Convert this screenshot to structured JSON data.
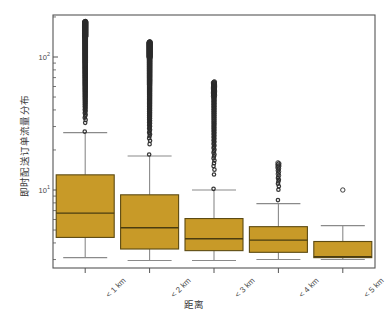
{
  "figure": {
    "y_axis_title": "即时配送订单流量分布",
    "x_axis_title": "距离",
    "y_tick_labels": [
      "10",
      "10"
    ],
    "y_tick_exponents": [
      "2",
      "1"
    ]
  },
  "chart_data": {
    "type": "box",
    "title": "",
    "xlabel": "距离",
    "ylabel": "即时配送订单流量分布",
    "yscale": "log",
    "ylim": [
      2.6,
      260
    ],
    "grid": false,
    "legend": null,
    "y_ticks_major": [
      10,
      100
    ],
    "y_ticks_major_text": [
      "10^1",
      "10^2"
    ],
    "categories": [
      "< 1 km",
      "< 2 km",
      "< 3 km",
      "< 4 km",
      "< 5 km"
    ],
    "boxes": [
      {
        "category": "< 1 km",
        "whisker_low": 3.1,
        "q1": 4.4,
        "median": 6.7,
        "q3": 13.0,
        "whisker_high": 27.0,
        "outlier_min": 27.5,
        "outlier_max": 185.0,
        "outlier_count_approx": 420,
        "outlier_density": "very-high"
      },
      {
        "category": "< 2 km",
        "whisker_low": 2.95,
        "q1": 3.6,
        "median": 5.2,
        "q3": 9.2,
        "whisker_high": 18.0,
        "outlier_min": 18.5,
        "outlier_max": 130.0,
        "outlier_count_approx": 300,
        "outlier_density": "very-high"
      },
      {
        "category": "< 3 km",
        "whisker_low": 2.95,
        "q1": 3.5,
        "median": 4.3,
        "q3": 6.1,
        "whisker_high": 10.0,
        "outlier_min": 10.2,
        "outlier_max": 65.0,
        "outlier_count_approx": 120,
        "outlier_density": "high"
      },
      {
        "category": "< 4 km",
        "whisker_low": 3.0,
        "q1": 3.4,
        "median": 4.2,
        "q3": 5.3,
        "whisker_high": 7.9,
        "outlier_min": 8.4,
        "outlier_max": 16.0,
        "outlier_count_approx": 22,
        "outlier_density": "medium"
      },
      {
        "category": "< 5 km",
        "whisker_low": 3.0,
        "q1": 3.1,
        "median": 3.15,
        "q3": 4.1,
        "whisker_high": 5.4,
        "outlier_min": 10.0,
        "outlier_max": 10.0,
        "outlier_count_approx": 1,
        "outlier_density": "low"
      }
    ],
    "colors": {
      "box_fill": "#c89a28",
      "box_edge": "#5c4a12",
      "median_line": "#4a3c10",
      "whisker": "#8a8a8a",
      "outlier_edge": "#2b2b2b",
      "frame": "#555555",
      "background": "#ffffff"
    }
  }
}
